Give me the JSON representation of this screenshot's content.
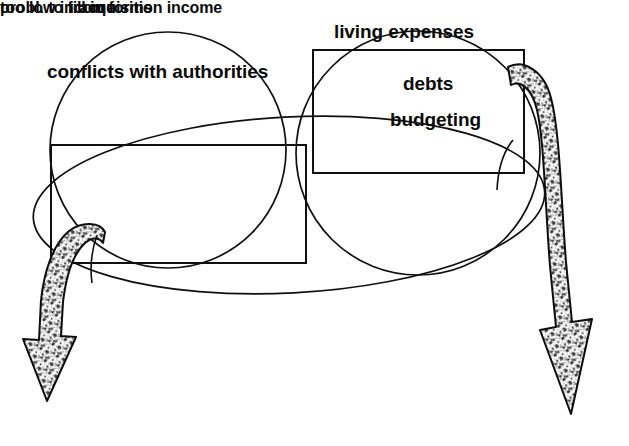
{
  "diagram": {
    "type": "venn-cluster-with-arrows",
    "background_color": "#ffffff",
    "stroke_color": "#101010",
    "text_color": "#0a0a0a",
    "title": "",
    "circles": [
      {
        "name": "left-circle",
        "label": "conflicts with authorities",
        "cx": 168,
        "cy": 150,
        "r": 118
      },
      {
        "name": "right-circle",
        "label": "probl. to fill in forms",
        "cx": 418,
        "cy": 153,
        "r": 122
      }
    ],
    "ellipse": {
      "name": "wide-ellipse",
      "cx": 289,
      "cy": 205,
      "rx": 256,
      "ry": 88,
      "rotation": -3
    },
    "rectangles": [
      {
        "name": "left-rectangle",
        "label": "acquisition income",
        "x": 51,
        "y": 145,
        "width": 255,
        "height": 118
      },
      {
        "name": "right-rectangle",
        "label": "living expenses",
        "x": 313,
        "y": 50,
        "width": 211,
        "height": 123
      }
    ],
    "labels": {
      "conflicts_with_authorities": "conflicts with authorities",
      "living_expenses": "living expenses",
      "debts": "debts",
      "budgeting": "budgeting",
      "acquisition_income": "acquisition income",
      "too_low_income": "too low income",
      "probl_to_fill_in_forms": "probl. to fill in forms"
    },
    "arrows": [
      {
        "name": "left-arrow",
        "direction": "down-left",
        "style": "curved-textured-block-arrow",
        "fill_texture": "stipple"
      },
      {
        "name": "right-arrow",
        "direction": "down-right",
        "style": "curved-textured-block-arrow",
        "fill_texture": "stipple"
      }
    ]
  }
}
